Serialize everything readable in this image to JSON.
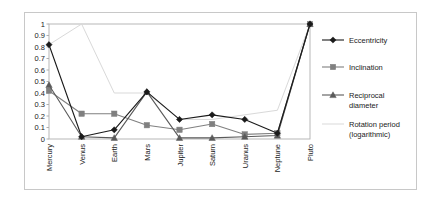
{
  "chart_data": {
    "type": "line",
    "title": "",
    "xlabel": "",
    "ylabel": "",
    "ylim": [
      0,
      1
    ],
    "ytick_labels": [
      "1",
      "0.9",
      "0.8",
      "0.7",
      "0.6",
      "0.5",
      "0.4",
      "0.3",
      "0.2",
      "0.1",
      "0"
    ],
    "ytick_values": [
      1,
      0.9,
      0.8,
      0.7,
      0.6,
      0.5,
      0.4,
      0.3,
      0.2,
      0.1,
      0
    ],
    "grid": false,
    "legend_position": "right",
    "categories": [
      "Mercury",
      "Venus",
      "Earth",
      "Mars",
      "Jupiter",
      "Saturn",
      "Uranus",
      "Neptune",
      "Pluto"
    ],
    "series": [
      {
        "name": "Eccentricity",
        "marker": "diamond",
        "color": "#1a1a1a",
        "values": [
          0.82,
          0.02,
          0.08,
          0.41,
          0.17,
          0.21,
          0.17,
          0.05,
          1.0
        ]
      },
      {
        "name": "Inclination",
        "marker": "square",
        "color": "#808080",
        "values": [
          0.42,
          0.22,
          0.22,
          0.12,
          0.08,
          0.13,
          0.04,
          0.05,
          1.0
        ]
      },
      {
        "name": "Reciprocal diameter",
        "marker": "triangle",
        "color": "#5a5a5a",
        "values": [
          0.47,
          0.02,
          0.01,
          0.41,
          0.01,
          0.01,
          0.02,
          0.03,
          1.0
        ]
      },
      {
        "name": "Rotation period (logarithmic)",
        "marker": "none",
        "color": "#d9d9d9",
        "values": [
          0.82,
          1.0,
          0.4,
          0.4,
          0.17,
          0.17,
          0.21,
          0.25,
          1.0
        ]
      }
    ]
  },
  "legend": {
    "items": [
      {
        "label": "Eccentricity"
      },
      {
        "label": "Inclination"
      },
      {
        "label": "Reciprocal"
      },
      {
        "label": "diameter"
      },
      {
        "label": "Rotation period"
      },
      {
        "label": "(logarithmic)"
      }
    ]
  }
}
